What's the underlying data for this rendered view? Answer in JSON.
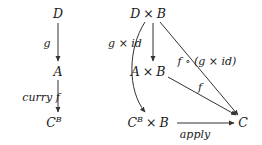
{
  "diagram": {
    "type": "commutative-diagram",
    "left": {
      "nodes": {
        "d": "D",
        "a": "A",
        "cb_base": "C",
        "cb_exp": "B"
      },
      "edges": {
        "g": "g",
        "curry_f": "curry f"
      }
    },
    "right": {
      "nodes": {
        "dxb_left": "D",
        "dxb_op": "×",
        "dxb_right": "B",
        "axb_left": "A",
        "axb_op": "×",
        "axb_right": "B",
        "cbxb_base": "C",
        "cbxb_exp": "B",
        "cbxb_op": "×",
        "cbxb_right": "B",
        "c": "C"
      },
      "edges": {
        "g_x_id": "g × id",
        "f_comp": "f ∘ (g × id)",
        "f": "f",
        "apply": "apply"
      }
    },
    "colors": {
      "ink": "#1a1a1a",
      "arrow": "#333333",
      "background": "#ffffff"
    }
  }
}
